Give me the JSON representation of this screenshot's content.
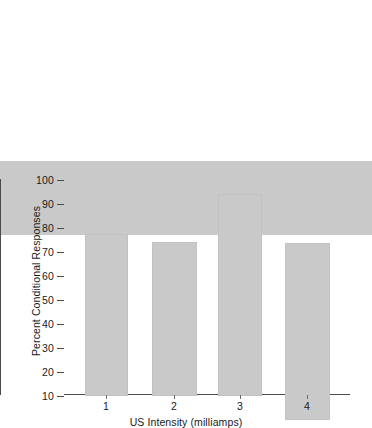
{
  "chart_data": {
    "type": "bar",
    "title": "",
    "xlabel": "US Intensity (milliamps)",
    "ylabel": "Percent Conditional Responses",
    "categories": [
      "1",
      "2",
      "3",
      "4"
    ],
    "values": [
      21,
      57.5,
      54,
      74
    ],
    "ylim": [
      0,
      100
    ],
    "ytick_labels": [
      "100",
      "90",
      "80",
      "70",
      "60",
      "50",
      "40",
      "30",
      "20",
      "10"
    ],
    "ytick_values": [
      100,
      90,
      80,
      70,
      60,
      50,
      40,
      30,
      20,
      10
    ],
    "xtick_labels": [
      "1",
      "2",
      "3",
      "4"
    ],
    "grid": false,
    "legend": false,
    "legend_position": "none",
    "bar_color": "#c9c9c9",
    "axis_color": "#4a4a4a",
    "background_color": "#ffffff"
  }
}
